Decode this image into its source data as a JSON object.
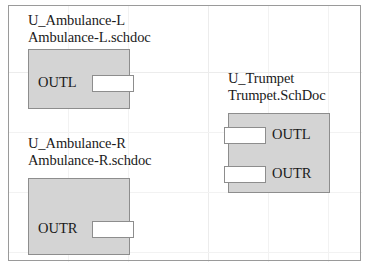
{
  "sheet": {
    "frame_color": "#9a9a9a",
    "background": "#ffffff",
    "grid_color": "#f2f2f2",
    "block_fill": "#d4d4d4",
    "block_border": "#8d8d8d",
    "port_fill": "#ffffff",
    "text_color": "#1b1b1b"
  },
  "blocks": [
    {
      "designator": "U_Ambulance-L",
      "filename": "Ambulance-L.schdoc",
      "ports": [
        {
          "name": "OUTL",
          "side": "right"
        }
      ]
    },
    {
      "designator": "U_Ambulance-R",
      "filename": "Ambulance-R.schdoc",
      "ports": [
        {
          "name": "OUTR",
          "side": "right"
        }
      ]
    },
    {
      "designator": "U_Trumpet",
      "filename": "Trumpet.SchDoc",
      "ports": [
        {
          "name": "OUTL",
          "side": "left"
        },
        {
          "name": "OUTR",
          "side": "left"
        }
      ]
    }
  ]
}
